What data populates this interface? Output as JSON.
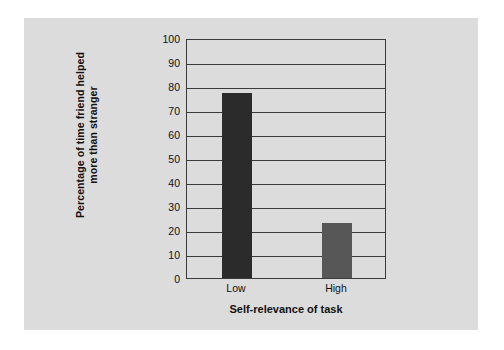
{
  "chart_data": {
    "type": "bar",
    "title": "",
    "subtitle": "",
    "categories": [
      "Low",
      "High"
    ],
    "values": [
      77,
      23
    ],
    "series": [
      {
        "name": "Percentage of time friend helped more than stranger",
        "values": [
          77,
          23
        ]
      }
    ],
    "xlabel": "Self-relevance of task",
    "ylabel_line1": "Percentage of time friend helped",
    "ylabel_line2": "more than stranger",
    "ylim": [
      0,
      100
    ],
    "ytick_labels": [
      "0",
      "10",
      "20",
      "30",
      "40",
      "50",
      "60",
      "70",
      "80",
      "90",
      "100"
    ],
    "ytick_values": [
      0,
      10,
      20,
      30,
      40,
      50,
      60,
      70,
      80,
      90,
      100
    ],
    "grid": "horizontal",
    "legend": "none",
    "bar_colors": [
      "#2b2b2b",
      "#575757"
    ]
  },
  "figure": {
    "background_color": "#dcdcdc",
    "page_color": "#ffffff",
    "axis_color": "#3a3a3a"
  }
}
